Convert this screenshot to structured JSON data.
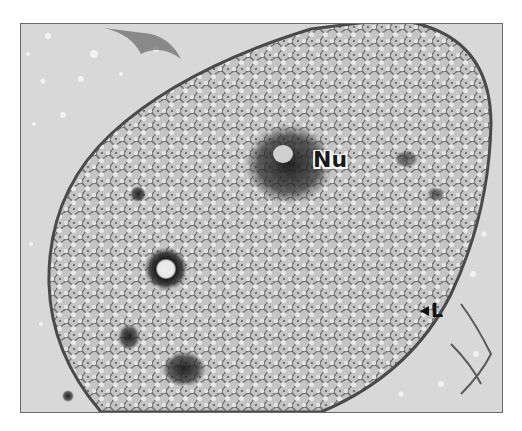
{
  "figure": {
    "type": "transmission electron micrograph",
    "labels": [
      {
        "id": "nu",
        "text": "Nu",
        "meaning": "nucleolus"
      },
      {
        "id": "l",
        "text": "L",
        "pointer": "left-pointing arrowhead"
      }
    ],
    "colors": {
      "background": "#d9d9d9",
      "cytoplasm": "#bdbdbd",
      "dense_region": "#2a2a2a",
      "frame_border": "#6a6a6a"
    }
  }
}
